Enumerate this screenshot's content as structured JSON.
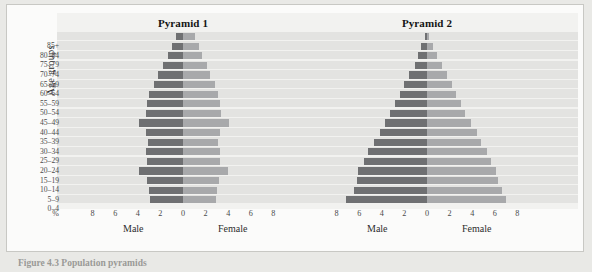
{
  "figure": {
    "caption": "Figure 4.3   Population pyramids",
    "y_axis_title": "Age groups",
    "percent_symbol": "%",
    "male_label": "Male",
    "female_label": "Female",
    "age_groups": [
      "85+",
      "80–84",
      "75–79",
      "70–74",
      "65–69",
      "60–64",
      "55–59",
      "50–54",
      "45–49",
      "40–44",
      "35–39",
      "30–34",
      "25–29",
      "20–24",
      "15–19",
      "10–14",
      "5–9",
      "0–4"
    ],
    "x_ticks": [
      "8",
      "6",
      "4",
      "2",
      "0",
      "2",
      "4",
      "6",
      "8"
    ],
    "colors": {
      "male_bar": "#6f7072",
      "female_bar": "#a8a9ab",
      "panel_background": "#f2f2f0",
      "stripe": "#e3e3e1",
      "card_background": "#fbfbfa",
      "page_background": "#e9e9e6"
    }
  },
  "chart_data": [
    {
      "type": "bar",
      "title": "Pyramid 1",
      "subtitle": "",
      "xlabel": "%",
      "ylabel": "Age groups",
      "xlim": [
        -9,
        9
      ],
      "xticks": [
        -8,
        -6,
        -4,
        -2,
        0,
        2,
        4,
        6,
        8
      ],
      "xticklabels": [
        "8",
        "6",
        "4",
        "2",
        "0",
        "2",
        "4",
        "6",
        "8"
      ],
      "grid": true,
      "legend": [
        "Male",
        "Female"
      ],
      "legend_position": "below-axis",
      "orientation": "horizontal-diverging",
      "categories": [
        "85+",
        "80–84",
        "75–79",
        "70–74",
        "65–69",
        "60–64",
        "55–59",
        "50–54",
        "45–49",
        "40–44",
        "35–39",
        "30–34",
        "25–29",
        "20–24",
        "15–19",
        "10–14",
        "5–9",
        "0–4"
      ],
      "series": [
        {
          "name": "Male",
          "values": [
            0.6,
            1.0,
            1.3,
            1.8,
            2.2,
            2.6,
            3.0,
            3.2,
            3.3,
            3.9,
            3.3,
            3.1,
            3.3,
            3.2,
            3.9,
            3.2,
            3.0,
            2.9
          ]
        },
        {
          "name": "Female",
          "values": [
            1.1,
            1.4,
            1.7,
            2.1,
            2.4,
            2.8,
            3.1,
            3.3,
            3.4,
            4.1,
            3.3,
            3.1,
            3.3,
            3.3,
            4.0,
            3.2,
            3.0,
            2.9
          ]
        }
      ]
    },
    {
      "type": "bar",
      "title": "Pyramid 2",
      "subtitle": "",
      "xlabel": "%",
      "ylabel": "Age groups",
      "xlim": [
        -9,
        9
      ],
      "xticks": [
        -8,
        -6,
        -4,
        -2,
        0,
        2,
        4,
        6,
        8
      ],
      "xticklabels": [
        "8",
        "6",
        "4",
        "2",
        "0",
        "2",
        "4",
        "6",
        "8"
      ],
      "grid": true,
      "legend": [
        "Male",
        "Female"
      ],
      "legend_position": "below-axis",
      "orientation": "horizontal-diverging",
      "categories": [
        "85+",
        "80–84",
        "75–79",
        "70–74",
        "65–69",
        "60–64",
        "55–59",
        "50–54",
        "45–49",
        "40–44",
        "35–39",
        "30–34",
        "25–29",
        "20–24",
        "15–19",
        "10–14",
        "5–9",
        "0–4"
      ],
      "series": [
        {
          "name": "Male",
          "values": [
            0.2,
            0.5,
            0.8,
            1.1,
            1.6,
            2.0,
            2.4,
            2.8,
            3.3,
            3.7,
            4.2,
            4.7,
            5.2,
            5.6,
            6.1,
            6.2,
            6.5,
            7.2
          ]
        },
        {
          "name": "Female",
          "values": [
            0.2,
            0.5,
            0.9,
            1.3,
            1.8,
            2.2,
            2.6,
            3.0,
            3.4,
            3.9,
            4.4,
            4.8,
            5.3,
            5.7,
            6.1,
            6.3,
            6.6,
            7.0
          ]
        }
      ]
    }
  ]
}
